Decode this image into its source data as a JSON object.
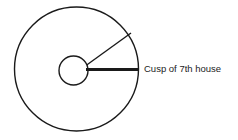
{
  "diagram": {
    "background_color": "#ffffff",
    "stroke_color": "#1a1a1a",
    "outer_circle": {
      "name": "outer-circle",
      "cx": 76.5,
      "cy": 69,
      "r": 62,
      "stroke_width": 1.4
    },
    "inner_circle": {
      "name": "inner-circle",
      "cx": 73.5,
      "cy": 70.5,
      "r": 14.5,
      "stroke_width": 1.4
    },
    "cusp_line": {
      "name": "cusp-line",
      "x1": 86,
      "y1": 69.5,
      "x2": 139,
      "y2": 69.5,
      "stroke_width": 2.8
    },
    "radial_line": {
      "name": "radial-line",
      "x1": 86,
      "y1": 65.5,
      "x2": 131,
      "y2": 33,
      "stroke_width": 1.4
    },
    "label": {
      "text": "Cusp of 7th house",
      "x": 144,
      "y": 69,
      "font_size": 9.5,
      "color": "#222222"
    }
  }
}
